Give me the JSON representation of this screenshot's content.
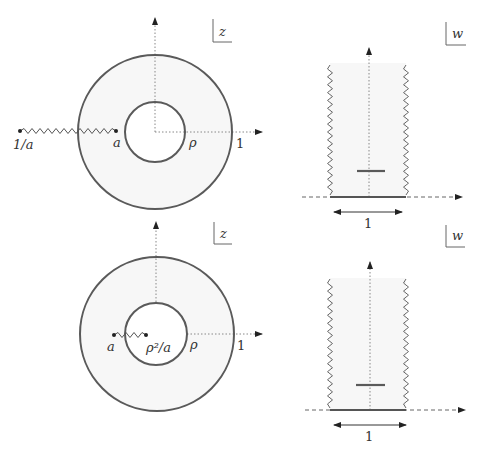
{
  "figure": {
    "colors": {
      "curve": "#5a5a5a",
      "cut": "#555555",
      "axis": "#777777",
      "fill": "#f7f7f7",
      "text": "#333333"
    },
    "panels": [
      {
        "id": "z-plane-top",
        "plane_label": "z",
        "labels": {
          "cut_start": "1/a",
          "cut_end": "a",
          "inner_radius": "ρ",
          "outer_radius": "1"
        },
        "branch_cut": "from a to 1/a (outside)"
      },
      {
        "id": "w-plane-top",
        "plane_label": "w",
        "labels": {
          "width": "1"
        }
      },
      {
        "id": "z-plane-bottom",
        "plane_label": "z",
        "labels": {
          "cut_start": "a",
          "cut_end": "ρ²/a",
          "inner_radius": "ρ",
          "outer_radius": "1"
        },
        "branch_cut": "from a to ρ²/a (inside)"
      },
      {
        "id": "w-plane-bottom",
        "plane_label": "w",
        "labels": {
          "width": "1"
        }
      }
    ]
  }
}
